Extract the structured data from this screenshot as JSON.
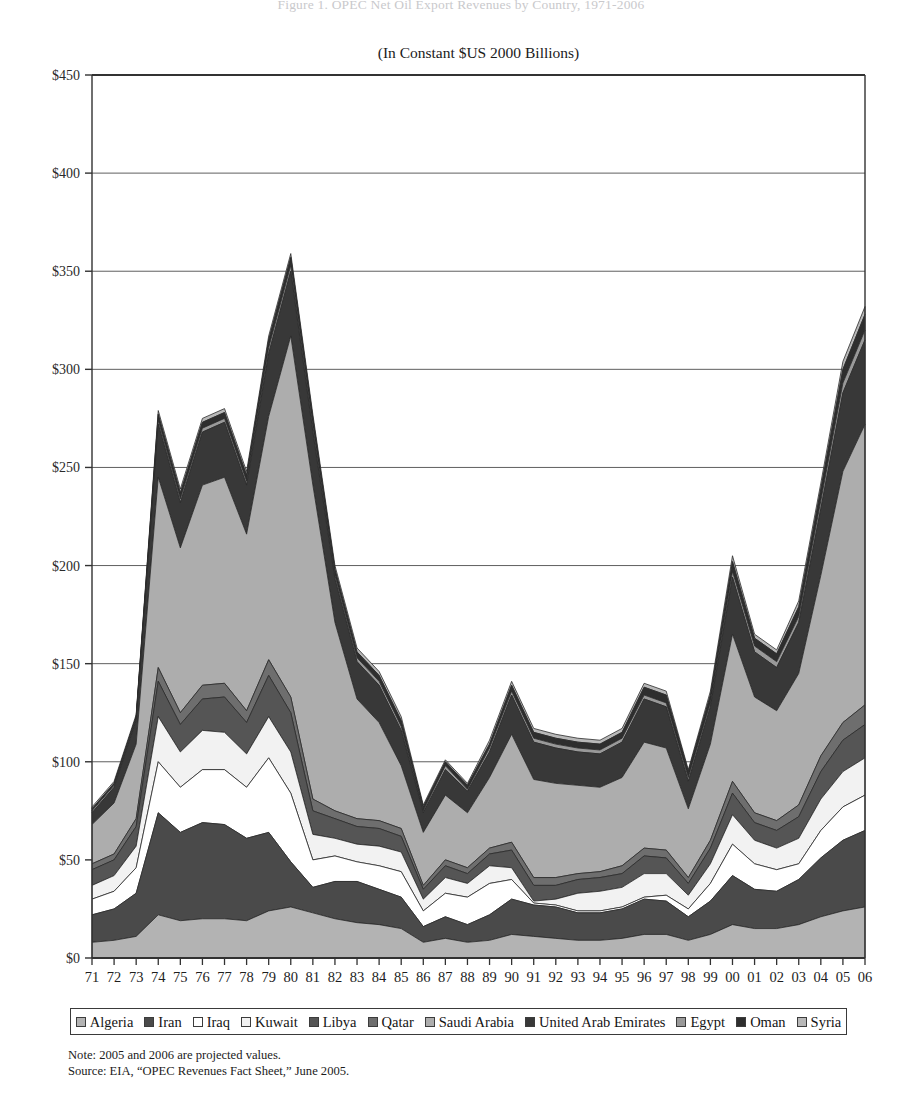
{
  "header": {
    "clipped_title": "Figure 1. OPEC Net Oil Export Revenues by Country, 1971-2006",
    "subtitle": "(In Constant $US 2000 Billions)"
  },
  "notes": {
    "line1": "Note: 2005 and 2006 are projected values.",
    "line2": "Source: EIA, “OPEC Revenues Fact Sheet,” June 2005."
  },
  "legend": {
    "position": "bottom",
    "items": [
      {
        "label": "Algeria",
        "color": "#b3b3b3",
        "swatch": "legend-swatch-algeria"
      },
      {
        "label": "Iran",
        "color": "#4a4a4a",
        "swatch": "legend-swatch-iran"
      },
      {
        "label": "Iraq",
        "color": "#ffffff",
        "swatch": "legend-swatch-iraq"
      },
      {
        "label": "Kuwait",
        "color": "#f2f2f2",
        "swatch": "legend-swatch-kuwait"
      },
      {
        "label": "Libya",
        "color": "#555555",
        "swatch": "legend-swatch-libya"
      },
      {
        "label": "Qatar",
        "color": "#6e6e6e",
        "swatch": "legend-swatch-qatar"
      },
      {
        "label": "Saudi Arabia",
        "color": "#adadad",
        "swatch": "legend-swatch-saudi-arabia"
      },
      {
        "label": "United Arab Emirates",
        "color": "#383838",
        "swatch": "legend-swatch-uae"
      },
      {
        "label": "Egypt",
        "color": "#999999",
        "swatch": "legend-swatch-egypt"
      },
      {
        "label": "Oman",
        "color": "#2e2e2e",
        "swatch": "legend-swatch-oman"
      },
      {
        "label": "Syria",
        "color": "#b8b8b8",
        "swatch": "legend-swatch-syria"
      }
    ]
  },
  "chart_data": {
    "type": "area",
    "stacked": true,
    "title": "Figure 1. OPEC Net Oil Export Revenues by Country, 1971-2006",
    "subtitle": "(In Constant $US 2000 Billions)",
    "xlabel": "",
    "ylabel": "",
    "grid": true,
    "grid_axis": "y",
    "ylim": [
      0,
      450
    ],
    "ytick_step": 50,
    "ytick_labels": [
      "$0",
      "$50",
      "$100",
      "$150",
      "$200",
      "$250",
      "$300",
      "$350",
      "$400",
      "$450"
    ],
    "ytick_values": [
      0,
      50,
      100,
      150,
      200,
      250,
      300,
      350,
      400,
      450
    ],
    "x": [
      "71",
      "72",
      "73",
      "74",
      "75",
      "76",
      "77",
      "78",
      "79",
      "80",
      "81",
      "82",
      "83",
      "84",
      "85",
      "86",
      "87",
      "88",
      "89",
      "90",
      "91",
      "92",
      "93",
      "94",
      "95",
      "96",
      "97",
      "98",
      "99",
      "00",
      "01",
      "02",
      "03",
      "04",
      "05",
      "06"
    ],
    "xlim_labels": [
      "71",
      "06"
    ],
    "units": "Constant $US 2000 Billions",
    "series": [
      {
        "name": "Algeria",
        "color": "#b3b3b3",
        "values": [
          8,
          9,
          11,
          22,
          19,
          20,
          20,
          19,
          24,
          26,
          23,
          20,
          18,
          17,
          15,
          8,
          10,
          8,
          9,
          12,
          11,
          10,
          9,
          9,
          10,
          12,
          12,
          9,
          12,
          17,
          15,
          15,
          17,
          21,
          24,
          26
        ]
      },
      {
        "name": "Iran",
        "color": "#4a4a4a",
        "values": [
          14,
          16,
          22,
          52,
          45,
          49,
          48,
          42,
          40,
          23,
          13,
          19,
          21,
          18,
          16,
          8,
          11,
          9,
          13,
          18,
          16,
          16,
          14,
          14,
          15,
          18,
          17,
          12,
          17,
          25,
          20,
          19,
          23,
          30,
          36,
          39
        ]
      },
      {
        "name": "Iraq",
        "color": "#ffffff",
        "values": [
          8,
          9,
          13,
          26,
          23,
          27,
          28,
          26,
          38,
          35,
          14,
          13,
          10,
          12,
          13,
          8,
          12,
          14,
          16,
          10,
          1,
          1,
          1,
          1,
          1,
          1,
          3,
          4,
          9,
          16,
          13,
          11,
          8,
          14,
          17,
          18
        ]
      },
      {
        "name": "Kuwait",
        "color": "#f2f2f2",
        "values": [
          7,
          8,
          11,
          23,
          18,
          20,
          19,
          17,
          21,
          21,
          13,
          9,
          9,
          10,
          10,
          6,
          8,
          7,
          9,
          6,
          1,
          3,
          9,
          10,
          10,
          12,
          11,
          7,
          10,
          15,
          12,
          11,
          13,
          16,
          18,
          19
        ]
      },
      {
        "name": "Libya",
        "color": "#555555",
        "values": [
          8,
          8,
          10,
          18,
          14,
          16,
          18,
          16,
          21,
          20,
          12,
          10,
          9,
          9,
          8,
          5,
          6,
          5,
          6,
          9,
          8,
          7,
          7,
          7,
          7,
          9,
          8,
          6,
          8,
          11,
          9,
          9,
          11,
          14,
          16,
          17
        ]
      },
      {
        "name": "Qatar",
        "color": "#6e6e6e",
        "values": [
          3,
          3,
          4,
          7,
          6,
          7,
          7,
          6,
          8,
          8,
          6,
          4,
          4,
          4,
          4,
          2,
          3,
          3,
          3,
          4,
          4,
          4,
          3,
          3,
          4,
          4,
          4,
          3,
          4,
          6,
          5,
          5,
          6,
          8,
          9,
          10
        ]
      },
      {
        "name": "Saudi Arabia",
        "color": "#adadad",
        "values": [
          20,
          26,
          38,
          97,
          84,
          102,
          105,
          90,
          124,
          184,
          160,
          96,
          61,
          50,
          32,
          27,
          33,
          28,
          36,
          55,
          50,
          48,
          45,
          43,
          45,
          54,
          52,
          35,
          49,
          75,
          59,
          56,
          67,
          92,
          128,
          143
        ]
      },
      {
        "name": "United Arab Emirates",
        "color": "#383838",
        "values": [
          6,
          8,
          12,
          27,
          23,
          27,
          28,
          25,
          32,
          33,
          27,
          22,
          19,
          19,
          18,
          10,
          13,
          11,
          13,
          20,
          19,
          18,
          17,
          17,
          18,
          22,
          21,
          14,
          19,
          29,
          23,
          22,
          26,
          34,
          40,
          43
        ]
      },
      {
        "name": "Egypt",
        "color": "#999999",
        "values": [
          1,
          1,
          1,
          2,
          2,
          2,
          2,
          2,
          3,
          3,
          3,
          2,
          2,
          2,
          2,
          1,
          2,
          1,
          2,
          2,
          2,
          2,
          2,
          2,
          2,
          2,
          2,
          2,
          2,
          3,
          3,
          3,
          3,
          4,
          5,
          5
        ]
      },
      {
        "name": "Oman",
        "color": "#2e2e2e",
        "values": [
          1,
          1,
          1,
          3,
          3,
          3,
          3,
          3,
          4,
          4,
          4,
          3,
          3,
          3,
          3,
          2,
          2,
          2,
          2,
          3,
          3,
          3,
          3,
          3,
          3,
          4,
          4,
          3,
          4,
          5,
          4,
          4,
          5,
          6,
          7,
          8
        ]
      },
      {
        "name": "Syria",
        "color": "#b8b8b8",
        "values": [
          1,
          1,
          1,
          2,
          2,
          2,
          2,
          2,
          2,
          2,
          2,
          2,
          2,
          2,
          2,
          1,
          1,
          1,
          2,
          2,
          2,
          2,
          2,
          2,
          2,
          2,
          2,
          1,
          2,
          3,
          2,
          2,
          3,
          3,
          4,
          4
        ]
      }
    ],
    "totals": [
      77,
      90,
      124,
      279,
      239,
      275,
      280,
      248,
      317,
      359,
      277,
      200,
      158,
      146,
      143,
      78,
      103,
      89,
      111,
      141,
      117,
      114,
      112,
      111,
      117,
      139,
      136,
      96,
      136,
      205,
      165,
      157,
      182,
      242,
      304,
      332
    ],
    "annotations": [
      {
        "text": "peak at 1980",
        "x": "80",
        "y": 428
      }
    ]
  },
  "plot_geometry": {
    "left": 92,
    "right": 865,
    "top": 75,
    "bottom": 958
  }
}
